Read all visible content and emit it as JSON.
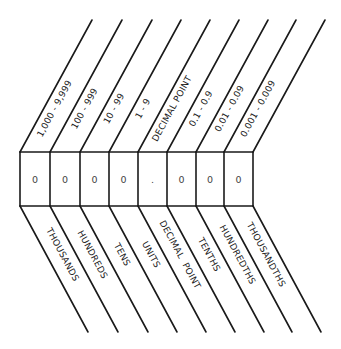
{
  "diagram": {
    "columns": [
      {
        "digit": "0",
        "range": "1,000 - 9,999",
        "place": "THOUSANDS"
      },
      {
        "digit": "0",
        "range": "100 - 999",
        "place": "HUNDREDS"
      },
      {
        "digit": "0",
        "range": "10 - 99",
        "place": "TENS"
      },
      {
        "digit": "0",
        "range": "1 - 9",
        "place": "UNITS"
      },
      {
        "digit": ".",
        "range": "DECIMAL POINT",
        "place": "DECIMAL  POINT"
      },
      {
        "digit": "0",
        "range": "0.1 - 0.9",
        "place": "TENTHS"
      },
      {
        "digit": "0",
        "range": "0.01 - 0.09",
        "place": "HUNDREDTHS"
      },
      {
        "digit": "0",
        "range": "0.001 - 0.009",
        "place": "THOUSANDTHS"
      }
    ],
    "stroke_color": "#1a1a1a",
    "background": "#ffffff"
  }
}
